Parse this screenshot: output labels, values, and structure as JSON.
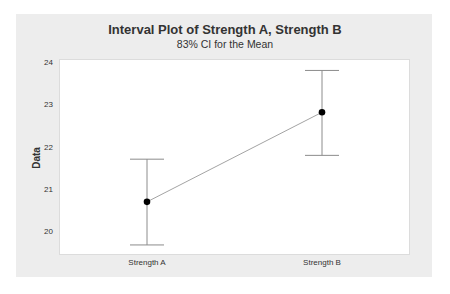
{
  "chart_data": {
    "type": "interval",
    "title": "Interval Plot of Strength A, Strength B",
    "subtitle": "83% CI for the Mean",
    "xlabel": "",
    "ylabel": "Data",
    "categories": [
      "Strength A",
      "Strength B"
    ],
    "series": [
      {
        "name": "Mean with 83% CI",
        "means": [
          20.69,
          22.81
        ],
        "ci_lower": [
          19.67,
          21.79
        ],
        "ci_upper": [
          21.7,
          23.8
        ]
      }
    ],
    "yticks": [
      20,
      21,
      22,
      23,
      24
    ],
    "ylim": [
      19.43,
      24.07
    ],
    "grid": false,
    "legend": "none",
    "connect_means": true
  },
  "colors": {
    "background": "#ededed",
    "plot_area": "#ffffff",
    "interval_line": "#8c8c8c",
    "mean_point": "#000000",
    "connect_line": "#8c8c8c"
  }
}
